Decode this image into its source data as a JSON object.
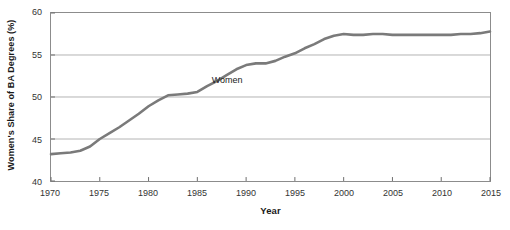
{
  "chart_data": {
    "type": "line",
    "title": "",
    "xlabel": "Year",
    "ylabel": "Women's Share of BA Degrees (%)",
    "xlim": [
      1970,
      2015
    ],
    "ylim": [
      40,
      60
    ],
    "grid": true,
    "legend_position": "inline-annotation",
    "xticks": [
      1970,
      1975,
      1980,
      1985,
      1990,
      1995,
      2000,
      2005,
      2010,
      2015
    ],
    "yticks": [
      40,
      45,
      50,
      55,
      60
    ],
    "series": [
      {
        "name": "Women",
        "color": "#7a7a7a",
        "x": [
          1970,
          1971,
          1972,
          1973,
          1974,
          1975,
          1976,
          1977,
          1978,
          1979,
          1980,
          1981,
          1982,
          1983,
          1984,
          1985,
          1986,
          1987,
          1988,
          1989,
          1990,
          1991,
          1992,
          1993,
          1994,
          1995,
          1996,
          1997,
          1998,
          1999,
          2000,
          2001,
          2002,
          2003,
          2004,
          2005,
          2006,
          2007,
          2008,
          2009,
          2010,
          2011,
          2012,
          2013,
          2014,
          2015
        ],
        "values": [
          43.2,
          43.3,
          43.4,
          43.6,
          44.1,
          45.0,
          45.7,
          46.4,
          47.2,
          48.0,
          48.9,
          49.6,
          50.2,
          50.3,
          50.4,
          50.6,
          51.3,
          51.9,
          52.6,
          53.3,
          53.8,
          54.0,
          54.0,
          54.3,
          54.8,
          55.2,
          55.8,
          56.3,
          56.9,
          57.3,
          57.5,
          57.4,
          57.4,
          57.5,
          57.5,
          57.4,
          57.4,
          57.4,
          57.4,
          57.4,
          57.4,
          57.4,
          57.5,
          57.5,
          57.6,
          57.8
        ]
      }
    ],
    "annotations": [
      {
        "text": "Women",
        "x": 1986.5,
        "y": 51.9
      }
    ]
  }
}
